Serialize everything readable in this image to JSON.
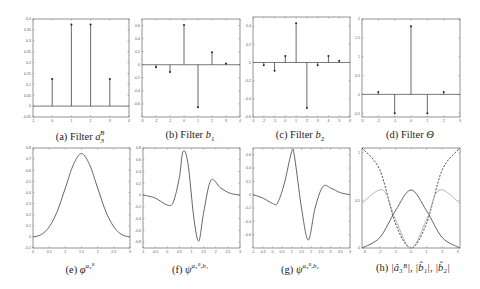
{
  "figure": {
    "captions": {
      "a": "(a) Filter a₃ᴮ",
      "b": "(b) Filter b₁",
      "c": "(c) Filter b₂",
      "d": "(d) Filter Θ",
      "e": "(e) φ^{a₃ᴮ}",
      "f": "(f) ψ^{a₃ᴮ,b₁}",
      "g": "(g) ψ^{a₃ᴮ,b₂}",
      "h": "(h) |â₃ᴮ|, |b̂₁|, |b̂₂|"
    },
    "caption_parts": {
      "a": {
        "prefix": "(a) Filter ",
        "sym": "a",
        "sup": "B",
        "sub": "3"
      },
      "b": {
        "prefix": "(b) Filter ",
        "sym": "b",
        "sub": "1"
      },
      "c": {
        "prefix": "(c) Filter ",
        "sym": "b",
        "sub": "2"
      },
      "d": {
        "prefix": "(d) Filter ",
        "sym": "Θ"
      },
      "e": {
        "prefix": "(e) ",
        "sym": "φ",
        "sup": "a₃ᴮ"
      },
      "f": {
        "prefix": "(f) ",
        "sym": "ψ",
        "sup": "a₃ᴮ,b₁"
      },
      "g": {
        "prefix": "(g) ",
        "sym": "ψ",
        "sup": "a₃ᴮ,b₂"
      },
      "h": {
        "prefix": "(h) ",
        "sym": "|â₃ᴮ|, |b̂₁|, |b̂₂|"
      }
    }
  },
  "chart_data": [
    {
      "id": "a",
      "type": "stem",
      "title": "(a) Filter a3^B",
      "xlim": [
        -1,
        4
      ],
      "ylim": [
        -0.05,
        0.4
      ],
      "xticks": [
        -1,
        0,
        1,
        2,
        3,
        4
      ],
      "yticks": [
        -0.05,
        0,
        0.05,
        0.1,
        0.15,
        0.2,
        0.25,
        0.3,
        0.35,
        0.4
      ],
      "x": [
        0,
        1,
        2,
        3
      ],
      "y": [
        0.125,
        0.375,
        0.375,
        0.125
      ]
    },
    {
      "id": "b",
      "type": "stem",
      "title": "(b) Filter b1",
      "xlim": [
        -3,
        4
      ],
      "ylim": [
        -0.8,
        0.7
      ],
      "xticks": [
        -3,
        -2,
        -1,
        0,
        1,
        2,
        3,
        4
      ],
      "yticks": [
        -0.6,
        -0.4,
        -0.2,
        0,
        0.2,
        0.4,
        0.6
      ],
      "x": [
        -2,
        -1,
        0,
        1,
        2,
        3
      ],
      "y": [
        -0.04,
        -0.11,
        0.61,
        -0.65,
        0.19,
        0.02
      ]
    },
    {
      "id": "c",
      "type": "stem",
      "title": "(c) Filter b2",
      "xlim": [
        -3,
        6
      ],
      "ylim": [
        -0.6,
        0.5
      ],
      "xticks": [
        -3,
        -2,
        -1,
        0,
        1,
        2,
        3,
        4,
        5,
        6
      ],
      "yticks": [
        -0.6,
        -0.4,
        -0.2,
        0,
        0.2,
        0.4
      ],
      "x": [
        -2,
        -1,
        0,
        1,
        2,
        3,
        4,
        5
      ],
      "y": [
        -0.03,
        -0.09,
        0.07,
        0.43,
        -0.5,
        -0.03,
        0.07,
        0.02
      ]
    },
    {
      "id": "d",
      "type": "stem",
      "title": "(d) Filter Θ",
      "xlim": [
        -3,
        3
      ],
      "ylim": [
        -0.6,
        2
      ],
      "xticks": [
        -3,
        -2,
        -1,
        0,
        1,
        2,
        3
      ],
      "yticks": [
        -0.5,
        0,
        0.5,
        1,
        1.5,
        2
      ],
      "x": [
        -2,
        -1,
        0,
        1,
        2
      ],
      "y": [
        0.06,
        -0.5,
        1.81,
        -0.5,
        0.06
      ]
    },
    {
      "id": "e",
      "type": "line",
      "title": "(e) phi^{a3^B}",
      "xlim": [
        0,
        3
      ],
      "ylim": [
        -0.1,
        0.8
      ],
      "xticks": [
        0,
        0.5,
        1,
        1.5,
        2,
        2.5,
        3
      ],
      "yticks": [
        -0.1,
        0,
        0.1,
        0.2,
        0.3,
        0.4,
        0.5,
        0.6,
        0.7,
        0.8
      ],
      "x": [
        0,
        0.25,
        0.5,
        0.75,
        1,
        1.25,
        1.5,
        1.75,
        2,
        2.25,
        2.5,
        2.75,
        3
      ],
      "y": [
        0,
        0.02,
        0.09,
        0.23,
        0.44,
        0.65,
        0.75,
        0.65,
        0.44,
        0.23,
        0.09,
        0.02,
        0
      ]
    },
    {
      "id": "f",
      "type": "line",
      "title": "(f) psi^{a3^B,b1}",
      "xlim": [
        -1,
        3
      ],
      "ylim": [
        -0.9,
        0.8
      ],
      "xticks": [
        -1,
        -0.5,
        0,
        0.5,
        1,
        1.5,
        2,
        2.5,
        3
      ],
      "yticks": [
        -0.8,
        -0.6,
        -0.4,
        -0.2,
        0,
        0.2,
        0.4,
        0.6,
        0.8
      ],
      "x": [
        -1,
        -0.5,
        0,
        0.25,
        0.5,
        0.65,
        0.85,
        1.1,
        1.3,
        1.5,
        1.8,
        2.2,
        2.6,
        3
      ],
      "y": [
        0,
        -0.05,
        -0.17,
        -0.12,
        0.3,
        0.74,
        0.55,
        -0.4,
        -0.78,
        -0.3,
        0.25,
        0.12,
        0.03,
        0
      ]
    },
    {
      "id": "g",
      "type": "line",
      "title": "(g) psi^{a3^B,b2}",
      "xlim": [
        -1,
        4
      ],
      "ylim": [
        -0.8,
        0.7
      ],
      "xticks": [
        -1,
        -0.5,
        0,
        0.5,
        1,
        1.5,
        2,
        2.5,
        3,
        3.5,
        4
      ],
      "yticks": [
        -0.6,
        -0.4,
        -0.2,
        0,
        0.2,
        0.4,
        0.6
      ],
      "x": [
        -1,
        -0.5,
        0,
        0.25,
        0.6,
        1,
        1.15,
        1.5,
        1.85,
        2.2,
        2.6,
        3,
        3.5,
        4
      ],
      "y": [
        0,
        -0.05,
        -0.13,
        -0.13,
        0.15,
        0.65,
        0.55,
        -0.2,
        -0.68,
        -0.2,
        0.12,
        0.1,
        0.03,
        0
      ]
    },
    {
      "id": "h",
      "type": "line",
      "title": "(h) |a3^B hat|, |b1 hat|, |b2 hat|",
      "xlim": [
        -3.14,
        3.14
      ],
      "ylim": [
        0,
        1.05
      ],
      "xticks": [
        -3,
        -2,
        -1,
        0,
        1,
        2,
        3
      ],
      "yticks": [
        0,
        0.5,
        1,
        1.5
      ],
      "series": [
        {
          "name": "|a3^B hat| (solid dark)",
          "style": "solid",
          "x": [
            -3.14,
            -2,
            -1,
            0,
            1,
            2,
            3.14
          ],
          "y": [
            0,
            0.11,
            0.39,
            0.61,
            0.39,
            0.11,
            0
          ]
        },
        {
          "name": "|b1 hat| (dashed)",
          "style": "dashed",
          "x": [
            -3.14,
            -2,
            -1,
            0,
            1,
            2,
            3.14
          ],
          "y": [
            1.05,
            0.82,
            0.26,
            0,
            0.26,
            0.82,
            1.05
          ]
        },
        {
          "name": "|b2 hat| (light solid)",
          "style": "light",
          "x": [
            -3.14,
            -1.8,
            -1,
            0,
            1,
            1.8,
            3.14
          ],
          "y": [
            0.47,
            0.61,
            0.3,
            0,
            0.3,
            0.61,
            0.47
          ]
        }
      ]
    }
  ]
}
